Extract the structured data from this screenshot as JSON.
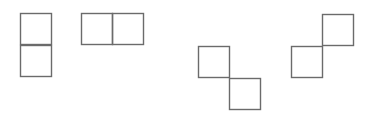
{
  "canvas": {
    "width": 374,
    "height": 115,
    "background": "#ffffff"
  },
  "style": {
    "stroke_color": "#6b6b6b",
    "square_size": 31
  },
  "shapes": [
    {
      "name": "vertical-domino",
      "squares": [
        {
          "x": 20,
          "y": 13
        },
        {
          "x": 20,
          "y": 45
        }
      ]
    },
    {
      "name": "horizontal-domino",
      "squares": [
        {
          "x": 81,
          "y": 13
        },
        {
          "x": 112,
          "y": 13
        }
      ]
    },
    {
      "name": "diagonal-down-right-pair",
      "squares": [
        {
          "x": 198,
          "y": 46
        },
        {
          "x": 229,
          "y": 78
        }
      ]
    },
    {
      "name": "diagonal-up-right-pair",
      "squares": [
        {
          "x": 291,
          "y": 46
        },
        {
          "x": 322,
          "y": 14
        }
      ]
    }
  ]
}
